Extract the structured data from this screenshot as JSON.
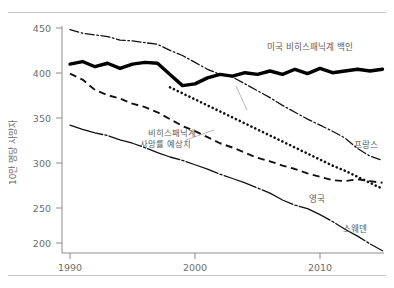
{
  "chart_data": {
    "type": "line",
    "title": "",
    "xlabel": "",
    "ylabel": "10만 명당 사망자",
    "xlim": [
      1989,
      2016
    ],
    "ylim": [
      180,
      462
    ],
    "grid": false,
    "legend_position": "inline-labels",
    "xticks": [
      "1990",
      "2000",
      "2010"
    ],
    "xtick_values": [
      1990,
      2000,
      2010
    ],
    "yticks": [
      "200",
      "250",
      "300",
      "350",
      "400",
      "450"
    ],
    "ytick_values": [
      200,
      250,
      300,
      350,
      400,
      450
    ],
    "annotations": [
      {
        "name": "projection-annotation",
        "text_line1": "비히스패닉계",
        "text_line2": "사망률 예상치"
      }
    ],
    "series": [
      {
        "name": "미국 비히스패닉계 백인",
        "style": "solid-bold",
        "x": [
          1990,
          1991,
          1992,
          1993,
          1994,
          1995,
          1996,
          1997,
          1998,
          1999,
          2000,
          2001,
          2002,
          2003,
          2004,
          2005,
          2006,
          2007,
          2008,
          2009,
          2010,
          2011,
          2012,
          2013,
          2014,
          2015
        ],
        "values": [
          408,
          411,
          405,
          409,
          403,
          408,
          410,
          409,
          396,
          383,
          385,
          392,
          396,
          394,
          398,
          396,
          400,
          396,
          402,
          397,
          403,
          398,
          400,
          402,
          400,
          402
        ]
      },
      {
        "name": "프랑스",
        "style": "dash-dot",
        "x": [
          1990,
          1991,
          1992,
          1993,
          1994,
          1995,
          1996,
          1997,
          1998,
          1999,
          2000,
          2001,
          2002,
          2003,
          2004,
          2005,
          2006,
          2007,
          2008,
          2009,
          2010,
          2011,
          2012,
          2013,
          2014,
          2015
        ],
        "values": [
          448,
          444,
          442,
          440,
          436,
          435,
          433,
          431,
          424,
          418,
          410,
          402,
          396,
          393,
          385,
          377,
          369,
          360,
          352,
          344,
          337,
          330,
          322,
          310,
          301,
          296
        ]
      },
      {
        "name": "영국",
        "style": "dashed",
        "x": [
          1990,
          1991,
          1992,
          1993,
          1994,
          1995,
          1996,
          1997,
          1998,
          1999,
          2000,
          2001,
          2002,
          2003,
          2004,
          2005,
          2006,
          2007,
          2008,
          2009,
          2010,
          2011,
          2012,
          2013,
          2014,
          2015
        ],
        "values": [
          397,
          390,
          378,
          372,
          368,
          362,
          358,
          352,
          344,
          336,
          330,
          323,
          316,
          311,
          305,
          299,
          295,
          290,
          286,
          281,
          277,
          273,
          272,
          274,
          272,
          270
        ]
      },
      {
        "name": "스웨덴",
        "style": "solid-thin",
        "x": [
          1990,
          1991,
          1992,
          1993,
          1994,
          1995,
          1996,
          1997,
          1998,
          1999,
          2000,
          2001,
          2002,
          2003,
          2004,
          2005,
          2006,
          2007,
          2008,
          2009,
          2010,
          2011,
          2012,
          2013,
          2014,
          2015
        ],
        "values": [
          337,
          332,
          328,
          325,
          320,
          316,
          311,
          305,
          300,
          296,
          291,
          286,
          280,
          275,
          270,
          264,
          258,
          250,
          244,
          240,
          233,
          225,
          216,
          208,
          199,
          191
        ]
      },
      {
        "name": "비히스패닉계 사망률 예상치",
        "style": "dotted",
        "x": [
          1998,
          1999,
          2000,
          2001,
          2002,
          2003,
          2004,
          2005,
          2006,
          2007,
          2008,
          2009,
          2010,
          2011,
          2012,
          2013,
          2014,
          2015
        ],
        "values": [
          381,
          374,
          367,
          360,
          353,
          346,
          339,
          332,
          325,
          318,
          311,
          304,
          297,
          290,
          284,
          277,
          270,
          263
        ]
      }
    ]
  },
  "axis": {
    "ylabel": "10만 명당 사망자"
  },
  "labels": {
    "us_white": "미국 비히스패닉계 백인",
    "france": "프랑스",
    "uk": "영국",
    "sweden": "스웨덴",
    "projection_l1": "비히스패닉계",
    "projection_l2": "사망률 예상치"
  }
}
